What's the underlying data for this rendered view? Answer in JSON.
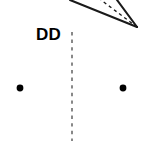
{
  "diagram": {
    "background_color": "#ffffff",
    "stroke_color": "#1a1a1a",
    "label": {
      "text": "DD",
      "x": 36,
      "y": 25
    },
    "angle_vertex": {
      "x": 137,
      "y": 27
    },
    "rays": [
      {
        "name": "upper-solid-ray",
        "style": "solid",
        "from_x": 137,
        "from_y": 27,
        "to_x": 70,
        "to_y": 0
      },
      {
        "name": "bisector-dashed-ray",
        "style": "dashed",
        "from_x": 137,
        "from_y": 27,
        "to_x": 101,
        "to_y": 0
      },
      {
        "name": "lower-solid-ray",
        "style": "solid",
        "from_x": 137,
        "from_y": 27,
        "to_x": 117,
        "to_y": 0
      }
    ],
    "vertical_dashed_line": {
      "name": "axis-of-symmetry",
      "style": "dashed",
      "x": 72,
      "y_top": 32,
      "y_bottom": 141
    },
    "points": [
      {
        "name": "left-point",
        "x": 20,
        "y": 88,
        "r": 3.4
      },
      {
        "name": "right-point",
        "x": 123,
        "y": 88,
        "r": 3.4
      }
    ]
  }
}
